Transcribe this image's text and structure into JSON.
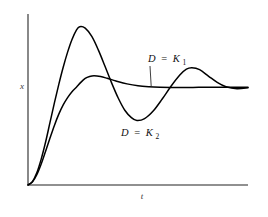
{
  "chart_data": {
    "type": "line",
    "title": "",
    "xlabel": "t",
    "ylabel": "x",
    "xlim": [
      0,
      10
    ],
    "ylim": [
      0,
      1.75
    ],
    "grid": false,
    "legend_position": "inline-annotations",
    "steady_state": 1.0,
    "annotations": [
      {
        "id": "k1",
        "text": "D = K1",
        "lhs": "D",
        "eq": "=",
        "rhs_symbol": "K",
        "rhs_subscript": "1",
        "description": "overdamped / critically damped response settling smoothly to steady state",
        "leader_line": true
      },
      {
        "id": "k2",
        "text": "D = K2",
        "lhs": "D",
        "eq": "=",
        "rhs_symbol": "K",
        "rhs_subscript": "2",
        "description": "underdamped oscillatory response with overshoot",
        "leader_line": false
      }
    ],
    "series": [
      {
        "name": "D = K1",
        "style": "solid",
        "color": "#000000",
        "overshoot": 1.12,
        "peak_time": 2.6,
        "x": [
          0.0,
          0.2,
          0.4,
          0.6,
          0.8,
          1.0,
          1.2,
          1.4,
          1.6,
          1.8,
          2.0,
          2.2,
          2.4,
          2.6,
          2.8,
          3.0,
          3.3,
          3.6,
          4.0,
          4.5,
          5.0,
          5.5,
          6.0,
          6.5,
          7.0,
          7.5,
          8.0,
          8.5,
          9.0,
          9.5,
          10.0
        ],
        "y": [
          0.0,
          0.03,
          0.105,
          0.215,
          0.345,
          0.48,
          0.61,
          0.725,
          0.82,
          0.895,
          0.955,
          1.0,
          1.05,
          1.09,
          1.11,
          1.118,
          1.11,
          1.092,
          1.065,
          1.035,
          1.015,
          1.005,
          1.0,
          0.998,
          0.998,
          0.999,
          1.0,
          1.0,
          1.0,
          1.0,
          1.0
        ]
      },
      {
        "name": "D = K2",
        "style": "solid",
        "color": "#000000",
        "overshoot": 1.62,
        "peak_time": 2.35,
        "undershoot": 0.66,
        "trough_time": 4.95,
        "second_peak": 1.2,
        "second_peak_time": 7.45,
        "x": [
          0.0,
          0.2,
          0.4,
          0.6,
          0.8,
          1.0,
          1.2,
          1.4,
          1.6,
          1.8,
          2.0,
          2.2,
          2.35,
          2.6,
          2.9,
          3.2,
          3.5,
          3.8,
          4.1,
          4.4,
          4.7,
          4.95,
          5.3,
          5.7,
          6.1,
          6.5,
          6.9,
          7.2,
          7.45,
          7.8,
          8.2,
          8.6,
          9.0,
          9.5,
          10.0
        ],
        "y": [
          0.0,
          0.035,
          0.125,
          0.265,
          0.44,
          0.64,
          0.84,
          1.03,
          1.205,
          1.36,
          1.49,
          1.585,
          1.62,
          1.605,
          1.52,
          1.38,
          1.215,
          1.045,
          0.89,
          0.765,
          0.69,
          0.66,
          0.68,
          0.76,
          0.88,
          1.01,
          1.125,
          1.185,
          1.2,
          1.18,
          1.115,
          1.05,
          1.005,
          0.985,
          0.995
        ]
      }
    ]
  },
  "axes": {
    "y_label": "x",
    "x_label": "t"
  }
}
